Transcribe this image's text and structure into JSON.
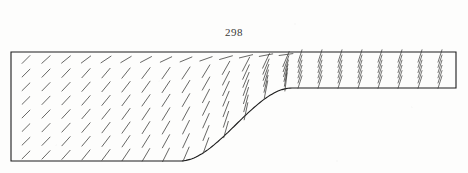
{
  "figure": {
    "label": "298",
    "caption_position": "top-center",
    "background_color": "#fdfdfc",
    "ink_color": "#1c1c1c",
    "arrow_color": "#3a3a38"
  },
  "chart_data": {
    "type": "scatter",
    "title": "298",
    "subtitle": "",
    "xlabel": "",
    "ylabel": "",
    "plot_kind": "vector-field-quiver",
    "grid": false,
    "legend": false,
    "xlim": [
      0,
      468
    ],
    "ylim": [
      173,
      0
    ],
    "domain_outline": {
      "name": "duct-wall",
      "top_wall_y": 52,
      "left_wall_x": 11,
      "right_wall_x": 456,
      "inlet_bottom_y": 161,
      "outlet_bottom_y": 88,
      "contraction_start_x": 180,
      "contraction_end_x": 292,
      "stroke": "#1c1c1c",
      "stroke_width": 1.1
    },
    "vector_grid": {
      "inlet_columns_x": [
        26,
        46,
        66,
        86,
        106,
        126,
        146,
        166
      ],
      "inlet_rows_y": [
        56,
        71,
        86,
        101,
        116,
        131,
        146,
        157
      ],
      "transition_columns_x": [
        186,
        206,
        226,
        246,
        266,
        286
      ],
      "outlet_columns_x": [
        306,
        326,
        346,
        366,
        386,
        406,
        426,
        446
      ],
      "outlet_rows_y": [
        56,
        61,
        66,
        71,
        76,
        81,
        86
      ]
    },
    "series": [
      {
        "name": "inlet-region-vectors",
        "angle_deg_from_horizontal": 45,
        "length_px": 11,
        "note": "Uniform 45 degree up-right vectors of equal short length filling the tall inlet section"
      },
      {
        "name": "top-row-vectors",
        "angle_deg_from_horizontal": 8,
        "length_px": 13,
        "note": "Vectors adjacent to the top wall flatten toward horizontal as x increases"
      },
      {
        "name": "contraction-vectors",
        "angle_deg_from_horizontal": 62,
        "length_px": 16,
        "note": "Vectors lengthen and steepen as flow is turned by the curved bottom wall"
      },
      {
        "name": "outlet-channel-vectors",
        "angle_deg_from_horizontal": 72,
        "length_px": 13,
        "note": "Short steep vectors packed in vertical columns across the narrow right channel"
      }
    ],
    "annotations": [
      {
        "text": "298",
        "x": 234,
        "y": 32,
        "role": "figure-number"
      }
    ]
  }
}
